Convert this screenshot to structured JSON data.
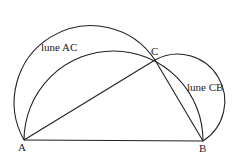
{
  "diagram": {
    "points": {
      "A": {
        "label": "A",
        "x": 24,
        "y": 140
      },
      "B": {
        "label": "B",
        "x": 203,
        "y": 141
      },
      "C": {
        "label": "C",
        "x": 155,
        "y": 60
      }
    },
    "labels": {
      "lune_ac": "lune AC",
      "lune_cb": "lune CB"
    },
    "colors": {
      "stroke": "#222222",
      "background": "#ffffff"
    }
  }
}
